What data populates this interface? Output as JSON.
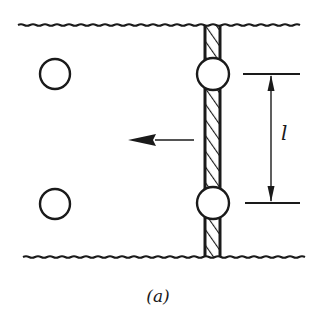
{
  "figure": {
    "caption": "(a)",
    "dimension_label": "l",
    "colors": {
      "ink": "#1a1a1a",
      "background": "#ffffff"
    },
    "elements": {
      "boundaries": [
        "top-wavy-boundary",
        "bottom-wavy-boundary"
      ],
      "rod": "hatched-vertical-rod",
      "rod_circles": [
        "upper-rod-circle",
        "lower-rod-circle"
      ],
      "free_circles": [
        "upper-left-circle",
        "lower-left-circle"
      ],
      "arrow_direction": "left",
      "dimension": "spacing between rod circles"
    }
  }
}
